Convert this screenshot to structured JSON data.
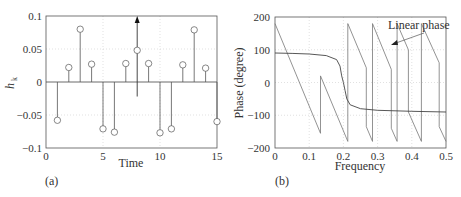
{
  "chart_data": [
    {
      "type": "stem",
      "panel_label": "(a)",
      "title": "",
      "xlabel": "Time",
      "ylabel": "h_k",
      "xlim": [
        0,
        15
      ],
      "ylim": [
        -0.1,
        0.1
      ],
      "xticks": [
        "0",
        "5",
        "10",
        "15"
      ],
      "yticks": [
        "0.1",
        "0.05",
        "0",
        "−0.05",
        "−0.1"
      ],
      "grid": true,
      "x": [
        1,
        2,
        3,
        4,
        5,
        6,
        7,
        8,
        9,
        10,
        11,
        12,
        13,
        14,
        15
      ],
      "values": [
        -0.058,
        0.022,
        0.08,
        0.027,
        -0.071,
        -0.076,
        0.028,
        0.048,
        0.028,
        -0.077,
        -0.071,
        0.026,
        0.079,
        0.021,
        -0.06
      ],
      "annotations": [
        {
          "type": "arrow",
          "x": 8,
          "from_y": -0.022,
          "to_y": 0.1,
          "note": "symmetry axis"
        }
      ]
    },
    {
      "type": "line",
      "panel_label": "(b)",
      "title": "",
      "xlabel": "Frequency",
      "ylabel": "Phase (degree)",
      "xlim": [
        0,
        0.5
      ],
      "ylim": [
        -200,
        200
      ],
      "xticks": [
        "0",
        "0.1",
        "0.2",
        "0.3",
        "0.4",
        "0.5"
      ],
      "yticks": [
        "200",
        "100",
        "0",
        "−100",
        "−200"
      ],
      "grid": true,
      "series": [
        {
          "name": "Linear phase (wrapped)",
          "x": [
            0,
            0.133,
            0.133,
            0.213,
            0.213,
            0.267,
            0.267,
            0.285,
            0.285,
            0.34,
            0.34,
            0.357,
            0.357,
            0.39,
            0.39,
            0.428,
            0.428,
            0.48,
            0.48,
            0.5
          ],
          "y": [
            180,
            -155,
            20,
            -180,
            180,
            45,
            -135,
            -180,
            180,
            40,
            -140,
            -180,
            180,
            100,
            -90,
            -180,
            180,
            60,
            -135,
            -180
          ]
        },
        {
          "name": "Nonlinear phase",
          "x": [
            0,
            0.05,
            0.1,
            0.15,
            0.18,
            0.19,
            0.195,
            0.2,
            0.205,
            0.21,
            0.22,
            0.25,
            0.3,
            0.4,
            0.5
          ],
          "y": [
            90,
            89,
            87,
            82,
            70,
            50,
            20,
            0,
            -25,
            -50,
            -68,
            -80,
            -85,
            -88,
            -90
          ]
        }
      ],
      "annotations": [
        {
          "text": "Linear phase",
          "x": 0.44,
          "y": 170
        }
      ]
    }
  ],
  "labels": {
    "a_panel": "(a)",
    "b_panel": "(b)",
    "a_xlabel": "Time",
    "a_ylabel": "h",
    "a_ylabel_sub": "k",
    "b_xlabel": "Frequency",
    "b_ylabel": "Phase (degree)",
    "b_annotation": "Linear phase"
  }
}
